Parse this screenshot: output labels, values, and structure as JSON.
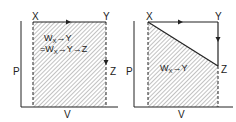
{
  "diagrams": [
    {
      "id": "left",
      "axes": {
        "y_label": "P",
        "x_label": "V"
      },
      "points": {
        "X": "X",
        "Y": "Y",
        "Z": "Z"
      },
      "process": "X→Y (isobaric), Y→Z (isochoric)",
      "annotation_line1": {
        "w": "W",
        "sub": "X",
        "rest": "→Y"
      },
      "annotation_line2": {
        "prefix": "=W",
        "sub": "X",
        "rest": "→Y→Z"
      }
    },
    {
      "id": "right",
      "axes": {
        "y_label": "P",
        "x_label": "V"
      },
      "points": {
        "X": "X",
        "Y": "Y",
        "Z": "Z"
      },
      "process": "X→Z direct path, X→Y→Z path",
      "annotation_line1": {
        "w": "W",
        "sub": "X",
        "rest": "→Y"
      }
    }
  ],
  "colors": {
    "line": "#222222",
    "hatch": "#555555",
    "background": "#ffffff"
  }
}
